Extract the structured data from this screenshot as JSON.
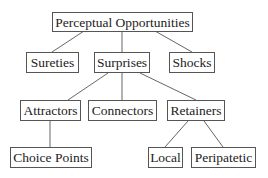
{
  "diagram": {
    "type": "tree",
    "nodes": {
      "root": {
        "label": "Perceptual Opportunities"
      },
      "sureties": {
        "label": "Sureties"
      },
      "surprises": {
        "label": "Surprises"
      },
      "shocks": {
        "label": "Shocks"
      },
      "attractors": {
        "label": "Attractors"
      },
      "connectors": {
        "label": "Connectors"
      },
      "retainers": {
        "label": "Retainers"
      },
      "choice_points": {
        "label": "Choice Points"
      },
      "local": {
        "label": "Local"
      },
      "peripatetic": {
        "label": "Peripatetic"
      }
    },
    "edges": [
      [
        "Perceptual Opportunities",
        "Sureties"
      ],
      [
        "Perceptual Opportunities",
        "Surprises"
      ],
      [
        "Perceptual Opportunities",
        "Shocks"
      ],
      [
        "Surprises",
        "Attractors"
      ],
      [
        "Surprises",
        "Connectors"
      ],
      [
        "Surprises",
        "Retainers"
      ],
      [
        "Attractors",
        "Choice Points"
      ],
      [
        "Retainers",
        "Local"
      ],
      [
        "Retainers",
        "Peripatetic"
      ]
    ]
  }
}
